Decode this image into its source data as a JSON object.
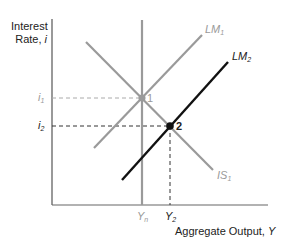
{
  "diagram": {
    "type": "IS-LM diagram",
    "y_axis_label": {
      "line1": "Interest",
      "line2": "Rate, ",
      "var": "i"
    },
    "x_axis_label": {
      "text": "Aggregate Output, ",
      "var": "Y"
    },
    "curves": [
      {
        "id": "IS1",
        "name": "IS",
        "sub": "1",
        "color": "#9a9a9a",
        "from": [
          86,
          42
        ],
        "to": [
          213,
          170
        ]
      },
      {
        "id": "LM1",
        "name": "LM",
        "sub": "1",
        "color": "#9a9a9a",
        "from": [
          94,
          148
        ],
        "to": [
          202,
          35
        ]
      },
      {
        "id": "LM2",
        "name": "LM",
        "sub": "2",
        "color": "#111111",
        "from": [
          122,
          180
        ],
        "to": [
          228,
          62
        ]
      },
      {
        "id": "Yn",
        "name": "vertical line at Y_n",
        "color": "#9a9a9a",
        "from": [
          142,
          20
        ],
        "to": [
          142,
          205
        ]
      }
    ],
    "points": [
      {
        "label": "1",
        "x": 142,
        "y": 98,
        "color": "#9a9a9a"
      },
      {
        "label": "2",
        "x": 170,
        "y": 126,
        "color": "#111111"
      }
    ],
    "y_ticks": [
      {
        "var": "i",
        "sub": "1",
        "y": 98,
        "color": "#9a9a9a"
      },
      {
        "var": "i",
        "sub": "2",
        "y": 126,
        "color": "#222222"
      }
    ],
    "x_ticks": [
      {
        "var": "Y",
        "sub": "n",
        "x": 142,
        "color": "#9a9a9a"
      },
      {
        "var": "Y",
        "sub": "2",
        "x": 170,
        "color": "#222222"
      }
    ],
    "colors": {
      "axis": "#555555",
      "grey": "#9a9a9a",
      "black": "#111111"
    }
  }
}
